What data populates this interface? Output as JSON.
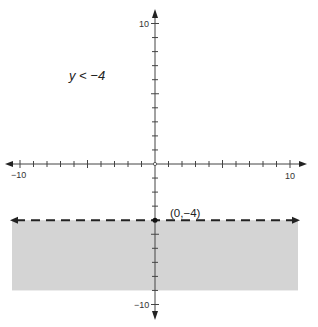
{
  "chart_data": {
    "type": "area",
    "title": "",
    "inequality": "y < −4",
    "boundary": {
      "equation": "y = -4",
      "style": "dashed",
      "color": "#222222"
    },
    "shaded_region": {
      "description": "below y = -4",
      "y_from": -9,
      "y_to": -4,
      "x_from": -10.5,
      "x_to": 10.5,
      "color": "#d4d4d4"
    },
    "point_label": "(0,−4)",
    "point": {
      "x": 0,
      "y": -4
    },
    "xlim": [
      -10,
      10
    ],
    "ylim": [
      -10,
      10
    ],
    "x_tick_labels": [
      "-10",
      "10"
    ],
    "y_tick_labels": [
      "10",
      "-10"
    ],
    "tick_step": 1,
    "grid": false,
    "xlabel": "",
    "ylabel": ""
  },
  "labels": {
    "inequality": "y < −4",
    "point": "(0,−4)",
    "x_min": "−10",
    "x_max": "10",
    "y_max": "10",
    "y_min": "−10"
  }
}
